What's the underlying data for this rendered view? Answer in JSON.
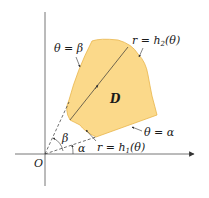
{
  "diagram": {
    "type": "polar-region",
    "colors": {
      "region_fill": "#fbd98a",
      "region_stroke": "#e8b54a",
      "axis": "#555555",
      "line": "#333333"
    },
    "labels": {
      "origin": "O",
      "region": "D",
      "beta_line": "θ = β",
      "alpha_line": "θ = α",
      "outer_curve": "r = h",
      "outer_sub": "2",
      "outer_arg": "(θ)",
      "inner_curve": "r = h",
      "inner_sub": "1",
      "inner_arg": "(θ)",
      "angle_beta": "β",
      "angle_alpha": "α"
    }
  }
}
